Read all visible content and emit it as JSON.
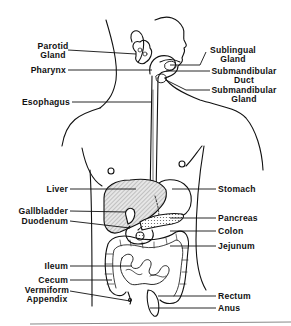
{
  "diagram": {
    "labels_left": [
      {
        "id": "parotid-gland",
        "text": "Parotid\nGland",
        "line1": "Parotid",
        "line2": "Gland"
      },
      {
        "id": "pharynx",
        "text": "Pharynx"
      },
      {
        "id": "esophagus",
        "text": "Esophagus"
      },
      {
        "id": "liver",
        "text": "Liver"
      },
      {
        "id": "gallbladder",
        "text": "Gallbladder"
      },
      {
        "id": "duodenum",
        "text": "Duodenum"
      },
      {
        "id": "ileum",
        "text": "Ileum"
      },
      {
        "id": "cecum",
        "text": "Cecum"
      },
      {
        "id": "vermiform-appendix",
        "line1": "Vermiform",
        "line2": "Appendix"
      }
    ],
    "labels_right": [
      {
        "id": "sublingual-gland",
        "line1": "Sublingual",
        "line2": "Gland"
      },
      {
        "id": "submandibular-duct",
        "line1": "Submandibular",
        "line2": "Duct"
      },
      {
        "id": "submandibular-gland",
        "line1": "Submandibular",
        "line2": "Gland"
      },
      {
        "id": "stomach",
        "text": "Stomach"
      },
      {
        "id": "pancreas",
        "text": "Pancreas"
      },
      {
        "id": "colon",
        "text": "Colon"
      },
      {
        "id": "jejunum",
        "text": "Jejunum"
      },
      {
        "id": "rectum",
        "text": "Rectum"
      },
      {
        "id": "anus",
        "text": "Anus"
      }
    ],
    "colors": {
      "line": "#111111",
      "liver_fill": "#cfcfcf",
      "background": "#ffffff"
    }
  }
}
